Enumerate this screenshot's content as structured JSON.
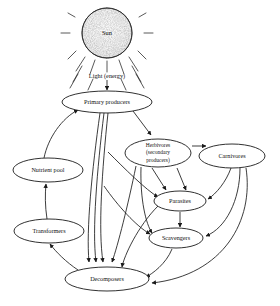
{
  "diagram": {
    "background_color": "#ffffff",
    "line_color": "#1a1a1a",
    "sun": {
      "label": "Sun",
      "fill_color": "#f2f2f2",
      "ray_count": 12
    },
    "energy_label": "Light (energy)",
    "nodes": [
      {
        "id": "primary_producers",
        "label": "Primary producers",
        "cx": 107,
        "cy": 102,
        "rx": 45,
        "ry": 11
      },
      {
        "id": "herbivores",
        "label_lines": [
          "Herbivores",
          "(secondary",
          "producers)"
        ],
        "cx": 158,
        "cy": 153,
        "rx": 33,
        "ry": 14
      },
      {
        "id": "carnivores",
        "label": "Carnivores",
        "cx": 232,
        "cy": 156,
        "rx": 33,
        "ry": 12
      },
      {
        "id": "parasites",
        "label": "Parasites",
        "cx": 180,
        "cy": 201,
        "rx": 26,
        "ry": 10
      },
      {
        "id": "scavengers",
        "label": "Scavengers",
        "cx": 176,
        "cy": 238,
        "rx": 27,
        "ry": 10
      },
      {
        "id": "nutrient_pool",
        "label": "Nutrient pool",
        "cx": 48,
        "cy": 170,
        "rx": 35,
        "ry": 12
      },
      {
        "id": "transformers",
        "label": "Transformers",
        "cx": 49,
        "cy": 231,
        "rx": 35,
        "ry": 12
      },
      {
        "id": "decomposers",
        "label": "Decomposers",
        "cx": 107,
        "cy": 279,
        "rx": 42,
        "ry": 12
      }
    ],
    "edges": [
      {
        "from": "sun",
        "to": "primary_producers",
        "kind": "light-energy"
      },
      {
        "from": "primary_producers",
        "to": "herbivores",
        "kind": "consumption"
      },
      {
        "from": "primary_producers",
        "to": "decomposers",
        "kind": "triple-flow"
      },
      {
        "from": "herbivores",
        "to": "carnivores",
        "kind": "consumption"
      },
      {
        "from": "herbivores",
        "to": "parasites",
        "kind": "consumption"
      },
      {
        "from": "herbivores",
        "to": "scavengers",
        "kind": "consumption"
      },
      {
        "from": "herbivores",
        "to": "decomposers",
        "kind": "death"
      },
      {
        "from": "carnivores",
        "to": "parasites",
        "kind": "consumption"
      },
      {
        "from": "carnivores",
        "to": "scavengers",
        "kind": "consumption"
      },
      {
        "from": "carnivores",
        "to": "decomposers",
        "kind": "death"
      },
      {
        "from": "parasites",
        "to": "scavengers",
        "kind": "consumption"
      },
      {
        "from": "parasites",
        "to": "decomposers",
        "kind": "death"
      },
      {
        "from": "scavengers",
        "to": "decomposers",
        "kind": "death"
      },
      {
        "from": "decomposers",
        "to": "transformers",
        "kind": "nutrient-flow"
      },
      {
        "from": "transformers",
        "to": "nutrient_pool",
        "kind": "nutrient-flow"
      },
      {
        "from": "nutrient_pool",
        "to": "primary_producers",
        "kind": "nutrient-uptake"
      }
    ]
  }
}
